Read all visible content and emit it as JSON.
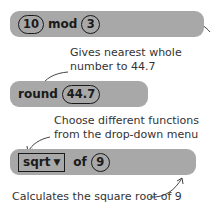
{
  "blocks": {
    "mod": {
      "left": "10",
      "operator": "mod",
      "right": "3"
    },
    "round": {
      "operator": "round",
      "value": "44.7"
    },
    "sqrt": {
      "function": "sqrt",
      "dropdown_icon": "caret-down-icon",
      "connector": "of",
      "value": "9"
    }
  },
  "notes": {
    "round_line1": "Gives nearest whole",
    "round_line2": "number to 44.7",
    "dropdown_line1": "Choose different functions",
    "dropdown_line2": "from the drop-down menu",
    "sqrt": "Calculates the square root of 9"
  },
  "colors": {
    "block": "#a8a8a8",
    "text": "#1a1a1a",
    "annotation": "#333333"
  }
}
